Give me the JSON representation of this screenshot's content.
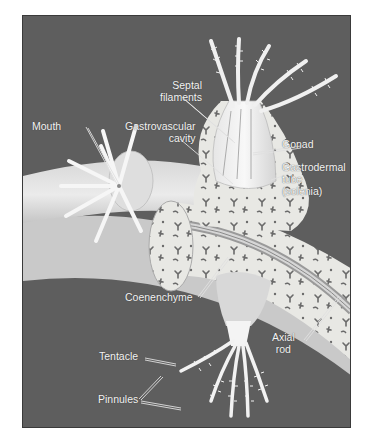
{
  "figure": {
    "background_color": "#5e5e5e",
    "labels": {
      "septal_filaments": [
        "Septal",
        "filaments"
      ],
      "mouth": "Mouth",
      "gastrovascular_cavity": [
        "Gastrovascular",
        "cavity"
      ],
      "gonad": "Gonad",
      "gastrodermal_tube": [
        "Gastrodermal",
        "tube",
        "(solenia)"
      ],
      "coenenchyme": "Coenenchyme",
      "axial_rod": [
        "Axial",
        "rod"
      ],
      "tentacle": "Tentacle",
      "pinnules": "Pinnules"
    }
  }
}
